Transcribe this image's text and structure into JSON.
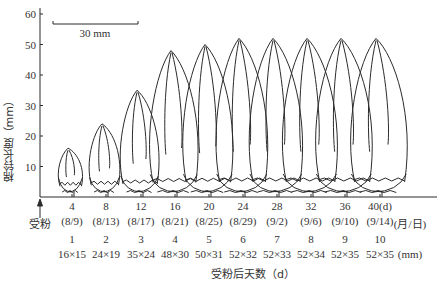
{
  "figure": {
    "y_axis": {
      "label": "棉铃长度（mm）",
      "ticks": [
        "10",
        "20",
        "30",
        "40",
        "50",
        "60"
      ],
      "tick_values": [
        10,
        20,
        30,
        40,
        50,
        60
      ]
    },
    "scale_bar": {
      "label": "30 mm"
    },
    "pollination_label": "受粉",
    "x_axis_title": "受粉后天数（d）",
    "days": [
      "4",
      "8",
      "12",
      "16",
      "20",
      "24",
      "28",
      "32",
      "36",
      "40(d)"
    ],
    "dates": [
      "(8/9)",
      "(8/13)",
      "(8/17)",
      "(8/21)",
      "(8/25)",
      "(8/29)",
      "(9/2)",
      "(9/6)",
      "(9/10)",
      "(9/14)"
    ],
    "dates_unit": "(月/日)",
    "boll_numbers": [
      "1",
      "2",
      "3",
      "4",
      "5",
      "6",
      "7",
      "8",
      "9",
      "10"
    ],
    "sizes": [
      "16×15",
      "24×19",
      "35×24",
      "48×30",
      "50×31",
      "52×32",
      "52×33",
      "52×34",
      "52×35",
      "52×35"
    ],
    "sizes_unit": "(mm)",
    "colors": {
      "line": "#2b2b2b",
      "text": "#333333",
      "background": "#ffffff"
    }
  },
  "chart_data": {
    "type": "diagram-series",
    "title": "",
    "xlabel": "受粉后天数（d）",
    "ylabel": "棉铃长度（mm）",
    "ylim": [
      0,
      60
    ],
    "categories": [
      "4",
      "8",
      "12",
      "16",
      "20",
      "24",
      "28",
      "32",
      "36",
      "40"
    ],
    "series": [
      {
        "name": "boll length (mm)",
        "values": [
          16,
          24,
          35,
          48,
          50,
          52,
          52,
          52,
          52,
          52
        ]
      },
      {
        "name": "boll width (mm)",
        "values": [
          15,
          19,
          24,
          30,
          31,
          32,
          33,
          34,
          35,
          35
        ]
      }
    ],
    "annotations": [
      "30 mm scale bar",
      "受粉 (pollination) arrow at day 0",
      "dates (月/日) 8/9 – 9/14"
    ]
  }
}
